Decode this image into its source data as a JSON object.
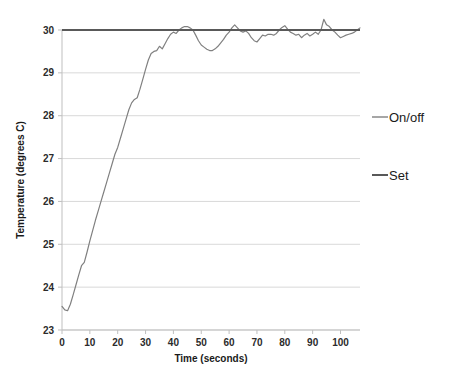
{
  "chart_data": {
    "type": "line",
    "title": "",
    "xlabel": "Time (seconds)",
    "ylabel": "Temperature (degrees C)",
    "xlim": [
      0,
      107
    ],
    "ylim": [
      23,
      30.4
    ],
    "xticks": [
      0,
      10,
      20,
      30,
      40,
      50,
      60,
      70,
      80,
      90,
      100
    ],
    "yticks": [
      23,
      24,
      25,
      26,
      27,
      28,
      29,
      30
    ],
    "grid": "horizontal",
    "legend_position": "right",
    "series": [
      {
        "name": "On/off",
        "color": "#808080",
        "x": [
          0,
          1,
          2,
          3,
          4,
          5,
          6,
          7,
          8,
          9,
          10,
          11,
          12,
          13,
          14,
          15,
          16,
          17,
          18,
          19,
          20,
          21,
          22,
          23,
          24,
          25,
          26,
          27,
          28,
          29,
          30,
          31,
          32,
          33,
          34,
          35,
          36,
          37,
          38,
          39,
          40,
          41,
          42,
          43,
          44,
          45,
          46,
          47,
          48,
          49,
          50,
          51,
          52,
          53,
          54,
          55,
          56,
          57,
          58,
          59,
          60,
          61,
          62,
          63,
          64,
          65,
          66,
          67,
          68,
          69,
          70,
          71,
          72,
          73,
          74,
          75,
          76,
          77,
          78,
          79,
          80,
          81,
          82,
          83,
          84,
          85,
          86,
          87,
          88,
          89,
          90,
          91,
          92,
          93,
          94,
          95,
          96,
          97,
          98,
          99,
          100,
          101,
          102,
          103,
          104,
          105,
          106,
          107
        ],
        "values": [
          23.55,
          23.47,
          23.45,
          23.6,
          23.82,
          24.05,
          24.28,
          24.5,
          24.58,
          24.82,
          25.08,
          25.32,
          25.56,
          25.78,
          26.0,
          26.22,
          26.44,
          26.66,
          26.88,
          27.1,
          27.26,
          27.48,
          27.7,
          27.92,
          28.14,
          28.3,
          28.38,
          28.42,
          28.62,
          28.85,
          29.08,
          29.3,
          29.45,
          29.5,
          29.52,
          29.62,
          29.56,
          29.68,
          29.8,
          29.9,
          29.95,
          29.92,
          30.0,
          30.05,
          30.08,
          30.08,
          30.05,
          30.0,
          29.88,
          29.75,
          29.65,
          29.6,
          29.55,
          29.52,
          29.52,
          29.56,
          29.62,
          29.7,
          29.78,
          29.88,
          29.95,
          30.05,
          30.12,
          30.05,
          29.98,
          29.95,
          29.98,
          29.92,
          29.82,
          29.75,
          29.72,
          29.8,
          29.88,
          29.86,
          29.9,
          29.9,
          29.88,
          29.92,
          30.0,
          30.06,
          30.1,
          30.02,
          29.95,
          29.92,
          29.88,
          29.9,
          29.82,
          29.88,
          29.92,
          29.86,
          29.9,
          29.95,
          29.9,
          30.0,
          30.25,
          30.12,
          30.08,
          30.0,
          29.95,
          29.88,
          29.82,
          29.85,
          29.88,
          29.9,
          29.92,
          29.95,
          30.0,
          30.05
        ]
      },
      {
        "name": "Set",
        "color": "#595959",
        "x": [
          0,
          107
        ],
        "values": [
          30,
          30
        ]
      }
    ]
  },
  "legend": {
    "items": [
      {
        "label": "On/off",
        "color": "#808080"
      },
      {
        "label": "Set",
        "color": "#595959"
      }
    ]
  },
  "axes": {
    "x_title": "Time (seconds)",
    "y_title": "Temperature (degrees C)",
    "x_tick_labels": [
      "0",
      "10",
      "20",
      "30",
      "40",
      "50",
      "60",
      "70",
      "80",
      "90",
      "100"
    ],
    "y_tick_labels": [
      "23",
      "24",
      "25",
      "26",
      "27",
      "28",
      "29",
      "30"
    ]
  }
}
